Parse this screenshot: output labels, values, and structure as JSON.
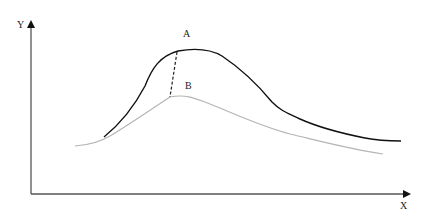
{
  "diagram": {
    "axes": {
      "x_label": "X",
      "y_label": "Y",
      "color": "#333333"
    },
    "points": {
      "a_label": "A",
      "b_label": "B"
    },
    "curves": [
      {
        "name": "upper-curve",
        "color": "#111111",
        "peak_label": "A"
      },
      {
        "name": "lower-curve",
        "color": "#b5b5b5",
        "peak_label": "B"
      }
    ],
    "connector": {
      "style": "dashed",
      "from": "A",
      "to": "B",
      "color": "#222222"
    }
  }
}
